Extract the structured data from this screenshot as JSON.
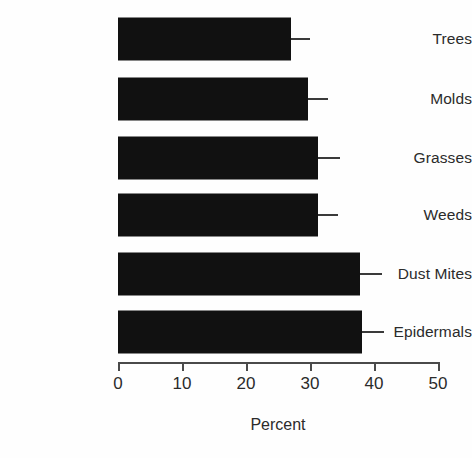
{
  "chart_data": {
    "type": "bar",
    "orientation": "horizontal",
    "title": "",
    "subtitle": "",
    "xlabel": "Percent",
    "ylabel": "",
    "categories": [
      "Trees",
      "Molds",
      "Grasses",
      "Weeds",
      "Dust Mites",
      "Epidermals"
    ],
    "values": [
      27.0,
      29.7,
      31.3,
      31.3,
      37.8,
      38.1
    ],
    "error_upper": [
      30.0,
      32.8,
      34.7,
      34.4,
      41.3,
      41.6
    ],
    "xlim": [
      0,
      50
    ],
    "xticks": [
      0,
      10,
      20,
      30,
      40,
      50
    ],
    "xtick_labels": [
      "0",
      "10",
      "20",
      "30",
      "40",
      "50"
    ],
    "grid": false,
    "legend": null,
    "bar_color": "#111111",
    "error_color": "#3a3a3a",
    "axis_color": "#4a4a4a",
    "background": "#fefefe"
  },
  "axis": {
    "title": "Percent"
  }
}
